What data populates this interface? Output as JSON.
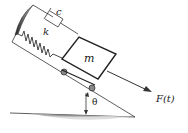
{
  "diagram": {
    "labels": {
      "damper": "c",
      "spring": "k",
      "mass": "m",
      "force": "F(t)",
      "angle": "θ"
    },
    "colors": {
      "line": "#333333",
      "shade": "#555555",
      "background": "#ffffff"
    }
  }
}
